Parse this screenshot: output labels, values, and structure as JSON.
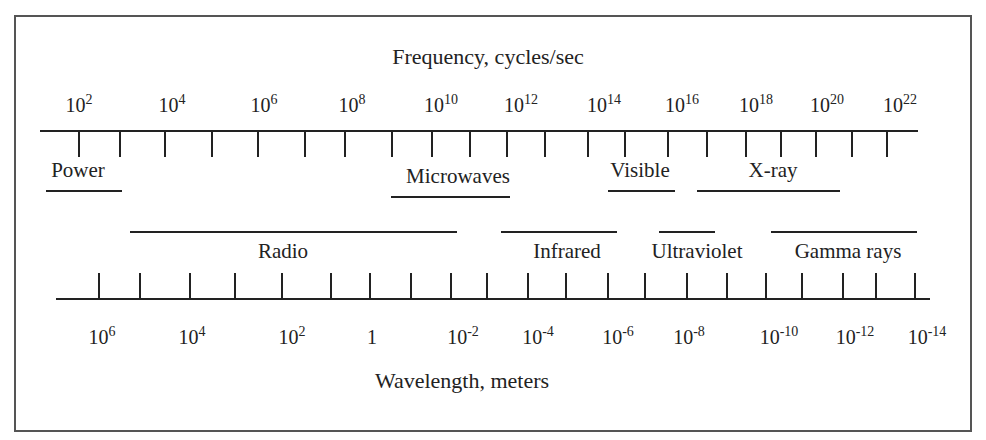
{
  "frequency_axis": {
    "title": "Frequency, cycles/sec",
    "labels": [
      {
        "base": "10",
        "exp": "2",
        "x": 79
      },
      {
        "base": "10",
        "exp": "4",
        "x": 172
      },
      {
        "base": "10",
        "exp": "6",
        "x": 264
      },
      {
        "base": "10",
        "exp": "8",
        "x": 352
      },
      {
        "base": "10",
        "exp": "10",
        "x": 441
      },
      {
        "base": "10",
        "exp": "12",
        "x": 521
      },
      {
        "base": "10",
        "exp": "14",
        "x": 604
      },
      {
        "base": "10",
        "exp": "16",
        "x": 682
      },
      {
        "base": "10",
        "exp": "18",
        "x": 756
      },
      {
        "base": "10",
        "exp": "20",
        "x": 827
      },
      {
        "base": "10",
        "exp": "22",
        "x": 900
      }
    ],
    "ticks": [
      79,
      120,
      165,
      212,
      258,
      305,
      345,
      392,
      432,
      470,
      507,
      545,
      588,
      625,
      668,
      707,
      746,
      781,
      816,
      852,
      887
    ]
  },
  "wavelength_axis": {
    "title": "Wavelength, meters",
    "labels": [
      {
        "base": "10",
        "exp": "6",
        "x": 102
      },
      {
        "base": "10",
        "exp": "4",
        "x": 192
      },
      {
        "base": "10",
        "exp": "2",
        "x": 292
      },
      {
        "base": "1",
        "exp": "",
        "x": 372
      },
      {
        "base": "10",
        "exp": "-2",
        "x": 463
      },
      {
        "base": "10",
        "exp": "-4",
        "x": 538
      },
      {
        "base": "10",
        "exp": "-6",
        "x": 618
      },
      {
        "base": "10",
        "exp": "-8",
        "x": 689
      },
      {
        "base": "10",
        "exp": "-10",
        "x": 779
      },
      {
        "base": "10",
        "exp": "-12",
        "x": 855
      },
      {
        "base": "10",
        "exp": "-14",
        "x": 927
      }
    ],
    "ticks": [
      99,
      140,
      190,
      235,
      282,
      331,
      370,
      411,
      451,
      487,
      528,
      566,
      608,
      645,
      687,
      727,
      766,
      802,
      843,
      876,
      915
    ]
  },
  "bands_upper": [
    {
      "label": "Power",
      "x1": 46,
      "x2": 122,
      "label_x": 78
    },
    {
      "label": "Microwaves",
      "x1": 391,
      "x2": 510,
      "label_x": 458
    },
    {
      "label": "Visible",
      "x1": 608,
      "x2": 675,
      "label_x": 640
    },
    {
      "label": "X-ray",
      "x1": 697,
      "x2": 840,
      "label_x": 773
    }
  ],
  "bands_lower": [
    {
      "label": "Radio",
      "x1": 130,
      "x2": 457,
      "label_x": 283
    },
    {
      "label": "Infrared",
      "x1": 501,
      "x2": 617,
      "label_x": 567
    },
    {
      "label": "Ultraviolet",
      "x1": 659,
      "x2": 715,
      "label_x": 697
    },
    {
      "label": "Gamma rays",
      "x1": 771,
      "x2": 917,
      "label_x": 848
    }
  ],
  "colors": {
    "ink": "#222222",
    "frame": "#555555",
    "background": "#ffffff"
  }
}
